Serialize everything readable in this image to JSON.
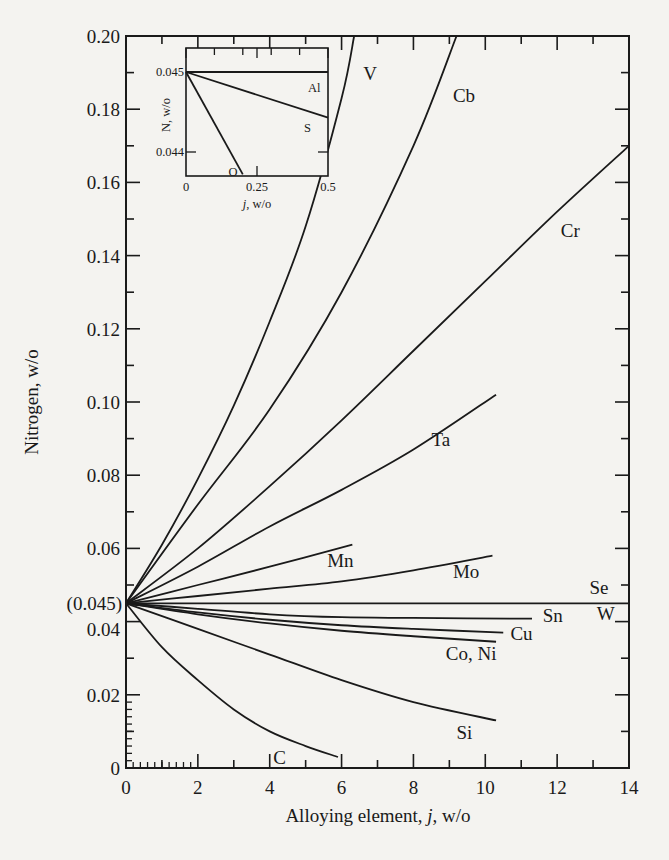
{
  "chart_data": {
    "type": "line",
    "title": "",
    "xlabel": "Alloying element, j, w/o",
    "ylabel": "Nitrogen, w/o",
    "xlim": [
      0,
      14
    ],
    "ylim": [
      0,
      0.2
    ],
    "x_ticks": [
      0,
      2,
      4,
      6,
      8,
      10,
      12,
      14
    ],
    "y_ticks": [
      0,
      0.02,
      0.04,
      0.06,
      0.08,
      0.1,
      0.12,
      0.14,
      0.16,
      0.18,
      0.2
    ],
    "y_tick_labels": [
      "0",
      "0.02",
      "0.04",
      "0.06",
      "0.08",
      "0.10",
      "0.12",
      "0.14",
      "0.16",
      "0.18",
      "0.20"
    ],
    "x_tick_labels": [
      "0",
      "2",
      "4",
      "6",
      "8",
      "10",
      "12",
      "14"
    ],
    "annotation_y": {
      "value": 0.045,
      "label": "(0.045)"
    },
    "grid": false,
    "legend": "none (curves labeled directly)",
    "series": [
      {
        "name": "V",
        "x": [
          0,
          1,
          2,
          3,
          4,
          5,
          6,
          6.35
        ],
        "y": [
          0.045,
          0.061,
          0.079,
          0.099,
          0.122,
          0.148,
          0.183,
          0.2
        ],
        "label_pos": [
          6.6,
          0.188
        ]
      },
      {
        "name": "Cb",
        "x": [
          0,
          2,
          4,
          6,
          8,
          9.2
        ],
        "y": [
          0.045,
          0.072,
          0.098,
          0.13,
          0.17,
          0.2
        ],
        "label_pos": [
          9.1,
          0.182
        ]
      },
      {
        "name": "Cr",
        "x": [
          0,
          2,
          4,
          6,
          8,
          10,
          12,
          14
        ],
        "y": [
          0.045,
          0.06,
          0.077,
          0.095,
          0.114,
          0.133,
          0.152,
          0.17
        ],
        "label_pos": [
          12.1,
          0.145
        ]
      },
      {
        "name": "Ta",
        "x": [
          0,
          2,
          4,
          6,
          8,
          10.3
        ],
        "y": [
          0.045,
          0.055,
          0.066,
          0.076,
          0.087,
          0.102
        ],
        "label_pos": [
          8.5,
          0.088
        ]
      },
      {
        "name": "Mn",
        "x": [
          0,
          2,
          4,
          6.3
        ],
        "y": [
          0.045,
          0.05,
          0.055,
          0.061
        ],
        "label_pos": [
          5.6,
          0.055
        ]
      },
      {
        "name": "Mo",
        "x": [
          0,
          2,
          4,
          6,
          8,
          10.2
        ],
        "y": [
          0.045,
          0.047,
          0.049,
          0.051,
          0.054,
          0.058
        ],
        "label_pos": [
          9.1,
          0.052
        ]
      },
      {
        "name": "Se",
        "x": [
          0,
          14
        ],
        "y": [
          0.045,
          0.045
        ],
        "label_pos": [
          12.9,
          0.0475
        ]
      },
      {
        "name": "W",
        "x": [
          0,
          14
        ],
        "y": [
          0.045,
          0.045
        ],
        "label_pos": [
          13.1,
          0.0405
        ]
      },
      {
        "name": "Sn",
        "x": [
          0,
          2,
          4,
          6,
          8,
          11.3
        ],
        "y": [
          0.045,
          0.0435,
          0.042,
          0.0412,
          0.041,
          0.0408
        ],
        "label_pos": [
          11.6,
          0.04
        ]
      },
      {
        "name": "Cu",
        "x": [
          0,
          2,
          4,
          6,
          8,
          10.5
        ],
        "y": [
          0.045,
          0.0425,
          0.0405,
          0.039,
          0.038,
          0.037
        ],
        "label_pos": [
          10.7,
          0.035
        ]
      },
      {
        "name": "Co, Ni",
        "x": [
          0,
          2,
          4,
          6,
          8,
          10.3
        ],
        "y": [
          0.045,
          0.042,
          0.0395,
          0.0375,
          0.036,
          0.0345
        ],
        "label_pos": [
          8.9,
          0.0295
        ]
      },
      {
        "name": "Si",
        "x": [
          0,
          2,
          4,
          6,
          8,
          10.3
        ],
        "y": [
          0.045,
          0.038,
          0.031,
          0.024,
          0.018,
          0.013
        ],
        "label_pos": [
          9.2,
          0.008
        ]
      },
      {
        "name": "C",
        "x": [
          0,
          1,
          2,
          3,
          4,
          5,
          5.9
        ],
        "y": [
          0.045,
          0.033,
          0.024,
          0.016,
          0.01,
          0.006,
          0.003
        ],
        "label_pos": [
          4.1,
          0.001
        ]
      }
    ],
    "inset": {
      "xlabel": "j, w/o",
      "ylabel": "N, w/o",
      "xlim": [
        0,
        0.5
      ],
      "ylim": [
        0.0437,
        0.0453
      ],
      "x_tick_labels": [
        "0",
        "0.25",
        "0.5"
      ],
      "y_tick_labels": [
        "0.045",
        "0.044"
      ],
      "x_ticks": [
        0,
        0.25,
        0.5
      ],
      "y_ticks": [
        0.045,
        0.044
      ],
      "series": [
        {
          "name": "Al",
          "x": [
            0,
            0.5
          ],
          "y": [
            0.045,
            0.045
          ]
        },
        {
          "name": "S",
          "x": [
            0,
            0.5
          ],
          "y": [
            0.045,
            0.04443
          ]
        },
        {
          "name": "O",
          "x": [
            0,
            0.2
          ],
          "y": [
            0.045,
            0.04372
          ]
        }
      ]
    }
  },
  "labels": {
    "xlabel_pre": "Alloying element, ",
    "xlabel_italic": "j",
    "xlabel_post": ", w/o",
    "ylabel": "Nitrogen, w/o",
    "annotation": "(0.045)",
    "inset_xlabel_italic": "j",
    "inset_xlabel_post": ", w/o",
    "inset_ylabel": "N, w/o"
  }
}
